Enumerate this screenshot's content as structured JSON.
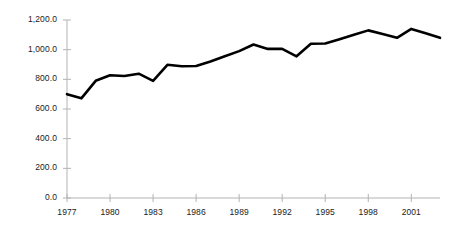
{
  "chart_data": {
    "type": "line",
    "title": "",
    "subtitle": "",
    "xlabel": "",
    "ylabel": "",
    "x": [
      1977,
      1978,
      1979,
      1980,
      1981,
      1982,
      1983,
      1984,
      1985,
      1986,
      1987,
      1988,
      1989,
      1990,
      1991,
      1992,
      1993,
      1994,
      1995,
      1996,
      1997,
      1998,
      1999,
      2000,
      2001,
      2002,
      2003
    ],
    "values": [
      700,
      672,
      790,
      828,
      822,
      838,
      790,
      898,
      888,
      890,
      920,
      955,
      990,
      1035,
      1005,
      1005,
      955,
      1040,
      1042,
      1070,
      1100,
      1130,
      1105,
      1080,
      1140,
      1110,
      1080
    ],
    "series": [
      {
        "name": "series-1",
        "color": "#000000",
        "values": [
          700,
          672,
          790,
          828,
          822,
          838,
          790,
          898,
          888,
          890,
          920,
          955,
          990,
          1035,
          1005,
          1005,
          955,
          1040,
          1042,
          1070,
          1100,
          1130,
          1105,
          1080,
          1140,
          1110,
          1080
        ]
      }
    ],
    "xlim": [
      1977,
      2003
    ],
    "ylim": [
      0,
      1200
    ],
    "ytick_values": [
      0,
      200,
      400,
      600,
      800,
      1000,
      1200
    ],
    "ytick_labels": [
      "0.0",
      "200.0",
      "400.0",
      "600.0",
      "800.0",
      "1,000.0",
      "1,200.0"
    ],
    "xtick_values": [
      1977,
      1980,
      1983,
      1986,
      1989,
      1992,
      1995,
      1998,
      2001
    ],
    "xtick_labels": [
      "1977",
      "1980",
      "1983",
      "1986",
      "1989",
      "1992",
      "1995",
      "1998",
      "2001"
    ],
    "grid": false,
    "legend": null,
    "legend_position": "none",
    "annotations": [],
    "axis_color": "#b3b3b3",
    "line_color": "#000000",
    "line_width": 2.6,
    "background": "#ffffff"
  }
}
